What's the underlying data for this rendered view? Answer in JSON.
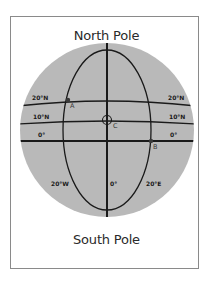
{
  "diagram": {
    "title_top": "North Pole",
    "title_bottom": "South Pole",
    "colors": {
      "globe_fill": "#b9b9b9",
      "line": "#1a1a1a",
      "frame": "#8a8a8a"
    },
    "latitudes": [
      {
        "label_left": "20°N",
        "label_right": "20°N"
      },
      {
        "label_left": "10°N",
        "label_right": "10°N"
      },
      {
        "label_left": "0°",
        "label_right": "0°"
      }
    ],
    "meridians": [
      {
        "label": "20°W"
      },
      {
        "label": "0°"
      },
      {
        "label": "20°E"
      }
    ],
    "points": [
      {
        "label": "A"
      },
      {
        "label": "B"
      },
      {
        "label": "C"
      }
    ]
  }
}
